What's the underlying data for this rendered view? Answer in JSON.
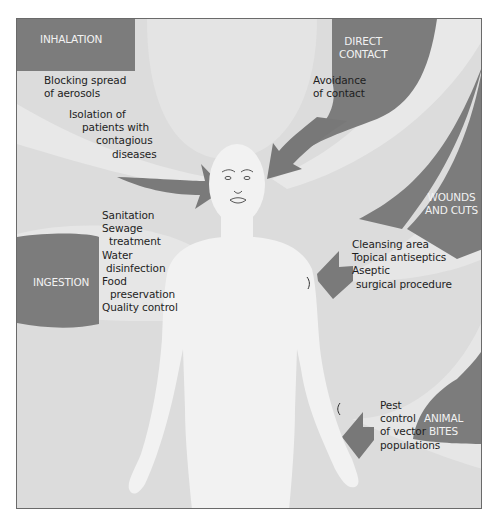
{
  "diagram": {
    "colors": {
      "background": "#dcdcdc",
      "band_light": "#e6e6e6",
      "route_dark": "#7a7a7a",
      "body": "#f1f1f1",
      "frame_border": "#6a6a6a",
      "label_text": "#f2f2f2",
      "body_text": "#1e1e1e"
    },
    "routes": [
      {
        "id": "inhalation",
        "label": [
          "INHALATION"
        ],
        "measures": [
          "Blocking spread",
          "of aerosols",
          "Isolation of",
          "patients with",
          "contagious",
          "diseases"
        ]
      },
      {
        "id": "direct-contact",
        "label": [
          "DIRECT",
          "CONTACT"
        ],
        "measures": [
          "Avoidance",
          "of contact"
        ]
      },
      {
        "id": "wounds-and-cuts",
        "label": [
          "WOUNDS",
          "AND CUTS"
        ],
        "measures": [
          "Cleansing area",
          "Topical antiseptics",
          "Aseptic",
          "surgical procedure"
        ]
      },
      {
        "id": "ingestion",
        "label": [
          "INGESTION"
        ],
        "measures": [
          "Sanitation",
          "Sewage",
          "treatment",
          "Water",
          "disinfection",
          "Food",
          "preservation",
          "Quality control"
        ]
      },
      {
        "id": "animal-bites",
        "label": [
          "ANIMAL",
          "BITES"
        ],
        "measures": [
          "Pest",
          "control",
          "of vector",
          "populations"
        ]
      }
    ]
  }
}
